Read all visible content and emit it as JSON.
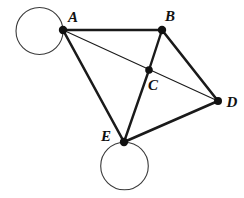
{
  "figure": {
    "background_color": "#ffffff",
    "stroke_color": "#1a1a1a",
    "vertex_fill": "#111111",
    "loop_stroke_color": "#3a3a3a",
    "canvas": {
      "width": 244,
      "height": 198
    }
  },
  "vertices": [
    {
      "id": "A",
      "label": "A",
      "x": 63,
      "y": 30,
      "r": 4.2,
      "label_x": 73,
      "label_y": 22
    },
    {
      "id": "B",
      "label": "B",
      "x": 162,
      "y": 30,
      "r": 4.2,
      "label_x": 170,
      "label_y": 21
    },
    {
      "id": "C",
      "label": "C",
      "x": 149,
      "y": 70,
      "r": 3.8,
      "label_x": 153,
      "label_y": 90
    },
    {
      "id": "D",
      "label": "D",
      "x": 218,
      "y": 101,
      "r": 4.0,
      "label_x": 232,
      "label_y": 107
    },
    {
      "id": "E",
      "label": "E",
      "x": 124,
      "y": 142,
      "r": 4.2,
      "label_x": 106,
      "label_y": 141
    }
  ],
  "edges": [
    {
      "id": "A-B",
      "from": "A",
      "to": "B",
      "x1": 63,
      "y1": 30,
      "x2": 162,
      "y2": 30,
      "width": 2.6
    },
    {
      "id": "A-D",
      "from": "A",
      "to": "D",
      "x1": 63,
      "y1": 30,
      "x2": 218,
      "y2": 101,
      "width": 1.1,
      "note": "passes through C"
    },
    {
      "id": "A-E",
      "from": "A",
      "to": "E",
      "x1": 63,
      "y1": 30,
      "x2": 124,
      "y2": 142,
      "width": 2.6
    },
    {
      "id": "B-C",
      "from": "B",
      "to": "C",
      "x1": 162,
      "y1": 30,
      "x2": 149,
      "y2": 70,
      "width": 2.4
    },
    {
      "id": "B-D",
      "from": "B",
      "to": "D",
      "x1": 162,
      "y1": 30,
      "x2": 218,
      "y2": 101,
      "width": 2.6
    },
    {
      "id": "C-E",
      "from": "C",
      "to": "E",
      "x1": 149,
      "y1": 70,
      "x2": 124,
      "y2": 142,
      "width": 2.4
    },
    {
      "id": "E-D",
      "from": "E",
      "to": "D",
      "x1": 124,
      "y1": 142,
      "x2": 218,
      "y2": 101,
      "width": 2.6
    }
  ],
  "loops": [
    {
      "id": "loop-A",
      "at": "A",
      "cx": 39.5,
      "cy": 31,
      "r": 23.5,
      "width": 1.1
    },
    {
      "id": "loop-E",
      "at": "E",
      "cx": 124.5,
      "cy": 166,
      "r": 23.8,
      "width": 1.1
    }
  ]
}
